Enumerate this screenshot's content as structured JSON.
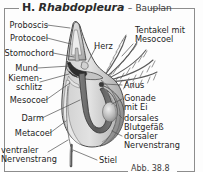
{
  "figure": {
    "title_prefix": "H.",
    "title_taxon": "Rhabdopleura",
    "title_dash": "–",
    "title_subtitle": "Bauplan",
    "caption": "Abb. 38.8"
  },
  "labels_left": [
    {
      "name": "proboscis",
      "text": "Proboscis"
    },
    {
      "name": "protocoel",
      "text": "Protocoel"
    },
    {
      "name": "stomochord",
      "text": "Stomochord"
    },
    {
      "name": "mund",
      "text": "Mund"
    },
    {
      "name": "kiemenschlitz",
      "text": "Kiemen-\nschlitz"
    },
    {
      "name": "mesocoel",
      "text": "Mesocoel"
    },
    {
      "name": "darm",
      "text": "Darm"
    },
    {
      "name": "metacoel",
      "text": "Metacoel"
    },
    {
      "name": "ventraler-nervenstrang",
      "text": "ventraler\nNervenstrang"
    }
  ],
  "labels_right": [
    {
      "name": "tentakel-mit-mesocoel",
      "text": "Tentakel mit\nMesocoel"
    },
    {
      "name": "herz",
      "text": "Herz"
    },
    {
      "name": "anus",
      "text": "Anus"
    },
    {
      "name": "gonade-mit-ei",
      "text": "Gonade\nmit Ei"
    },
    {
      "name": "dorsales-blutgefaess",
      "text": "dorsales\nBlutgefäß"
    },
    {
      "name": "dorsaler-nervenstrang",
      "text": "dorsaler\nNervenstrang"
    },
    {
      "name": "stiel",
      "text": "Stiel"
    }
  ],
  "colors": {
    "frame": "#8d8d8d",
    "text": "#1d1d1d",
    "outline": "#4a4a4a",
    "body_light": "#d9d9d9",
    "body_mid": "#b8b8b8",
    "body_dark": "#6e6e6e",
    "gut_dark": "#3a3a3a",
    "background": "#fdfdfd"
  }
}
